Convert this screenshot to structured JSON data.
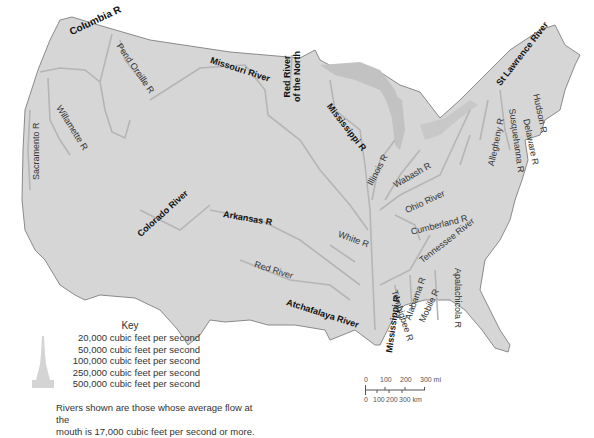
{
  "map": {
    "title": "Major rivers of the contiguous United States",
    "colors": {
      "land": "#d6d6d6",
      "border": "#8a8a8a",
      "river": "#b8b8b8",
      "lakes": "#c2c2c2",
      "background": "#ffffff"
    },
    "rivers": [
      {
        "name": "Columbia R",
        "major": true
      },
      {
        "name": "Pend Oreille R",
        "major": false
      },
      {
        "name": "Missouri River",
        "major": true
      },
      {
        "name": "Red River of the North",
        "major": true,
        "line1": "Red River",
        "line2": "of the North"
      },
      {
        "name": "Mississippi R",
        "major": true
      },
      {
        "name": "St Lawrence River",
        "major": true
      },
      {
        "name": "Willamette R",
        "major": false
      },
      {
        "name": "Sacramento R",
        "major": false
      },
      {
        "name": "Hudson R",
        "major": false
      },
      {
        "name": "Susquehanna R",
        "major": false
      },
      {
        "name": "Allegheny R",
        "major": false
      },
      {
        "name": "Delaware R",
        "major": false
      },
      {
        "name": "Illinois R",
        "major": false
      },
      {
        "name": "Wabash R",
        "major": false
      },
      {
        "name": "Ohio River",
        "major": false
      },
      {
        "name": "Colorado River",
        "major": true
      },
      {
        "name": "Arkansas R",
        "major": true
      },
      {
        "name": "Cumberland R",
        "major": false
      },
      {
        "name": "Tennessee River",
        "major": false
      },
      {
        "name": "White R",
        "major": false
      },
      {
        "name": "Red River",
        "major": false
      },
      {
        "name": "Mississippi R",
        "major": true
      },
      {
        "name": "Alabama R",
        "major": false
      },
      {
        "name": "Tombigbee R",
        "major": false
      },
      {
        "name": "Mobile R",
        "major": false
      },
      {
        "name": "Apalachicola R",
        "major": false
      },
      {
        "name": "Atchafalaya River",
        "major": true
      }
    ]
  },
  "key": {
    "title": "Key",
    "rows": [
      "20,000 cubic feet per second",
      "50,000 cubic feet per second",
      "100,000 cubic feet per second",
      "250,000 cubic feet per second",
      "500,000 cubic feet per second"
    ]
  },
  "note": {
    "line1": "Rivers shown are those whose average flow at the",
    "line2": "mouth is 17,000 cubic feet per second or more."
  },
  "scale_bar": {
    "miles": [
      "0",
      "100",
      "200",
      "300 mi"
    ],
    "km": [
      "0",
      "100",
      "200",
      "300 km"
    ]
  }
}
